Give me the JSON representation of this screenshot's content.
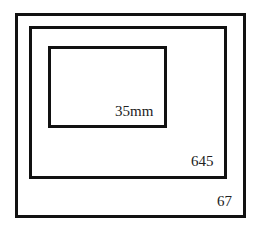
{
  "diagram": {
    "type": "nested-format-comparison",
    "colors": {
      "stroke": "#111111",
      "text": "#222222",
      "background": "#ffffff"
    },
    "frames": [
      {
        "id": "67",
        "label": "67",
        "box": {
          "x": 15,
          "y": 13,
          "w": 231,
          "h": 205
        },
        "label_pos": {
          "x": 217,
          "y": 194
        }
      },
      {
        "id": "645",
        "label": "645",
        "box": {
          "x": 29,
          "y": 26,
          "w": 198,
          "h": 153
        },
        "label_pos": {
          "x": 191,
          "y": 154
        }
      },
      {
        "id": "35mm",
        "label": "35mm",
        "box": {
          "x": 48,
          "y": 46,
          "w": 119,
          "h": 82
        },
        "label_pos": {
          "x": 115,
          "y": 104
        }
      }
    ]
  }
}
